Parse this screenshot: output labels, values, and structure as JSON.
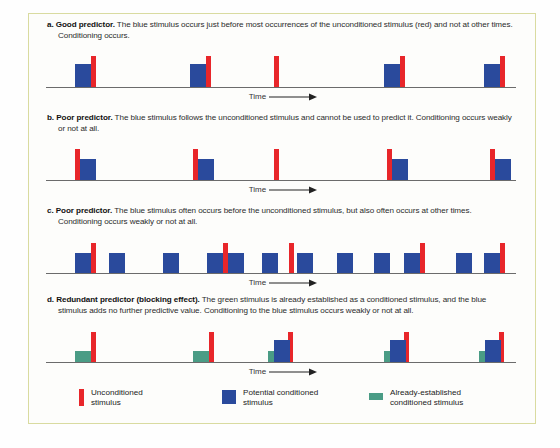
{
  "figure": {
    "border_color": "#d9dba0",
    "background_color": "#fdfdfb"
  },
  "colors": {
    "unconditioned_red": "#e8262a",
    "potential_conditioned_blue": "#2a4a9c",
    "already_established_green": "#4a9c85",
    "axis_gray": "#6b6b6b",
    "frame_olive": "#d9dba0"
  },
  "axis_label": {
    "text": "Time",
    "arrow": "⟶"
  },
  "panels": [
    {
      "id": "a",
      "marker": "a.",
      "title": "Good predictor.",
      "body": "The blue stimulus occurs just before most occurrences of the unconditioned stimulus (red) and not at other times. Conditioning occurs.",
      "time_label": "Time"
    },
    {
      "id": "b",
      "marker": "b.",
      "title": "Poor predictor.",
      "body": "The blue stimulus follows the unconditioned stimulus and cannot be used to predict it. Conditioning occurs weakly or not at all.",
      "time_label": "Time"
    },
    {
      "id": "c",
      "marker": "c.",
      "title": "Poor predictor.",
      "body": "The blue stimulus often occurs before the unconditioned stimulus, but also often occurs at other times. Conditioning occurs weakly or not at all.",
      "time_label": "Time"
    },
    {
      "id": "d",
      "marker": "d.",
      "title": "Redundant predictor (blocking effect).",
      "body": "The green stimulus is already established as a conditioned stimulus, and the blue stimulus adds no further predictive value. Conditioning to the blue stimulus occurs weakly or not at all.",
      "time_label": "Time"
    }
  ],
  "legend": {
    "items": [
      {
        "swatch": "red",
        "label": "Unconditioned\nstimulus"
      },
      {
        "swatch": "blue",
        "label": "Potential conditioned\nstimulus"
      },
      {
        "swatch": "green",
        "label": "Already-established\nconditioned stimulus"
      }
    ]
  },
  "chart_data": {
    "type": "bar",
    "xlabel": "Time",
    "ylabel": "",
    "grid": false,
    "legend_position": "bottom",
    "x_range": [
      0,
      470
    ],
    "series_styles": {
      "red": {
        "width": 5,
        "name": "Unconditioned stimulus"
      },
      "blue": {
        "width": 16,
        "name": "Potential conditioned stimulus"
      },
      "green": {
        "width": 16,
        "name": "Already-established conditioned stimulus"
      }
    },
    "panels": [
      {
        "id": "a",
        "bars": [
          {
            "color": "blue",
            "x": 29,
            "height": 23
          },
          {
            "color": "red",
            "x": 45,
            "height": 31
          },
          {
            "color": "blue",
            "x": 144,
            "height": 23
          },
          {
            "color": "red",
            "x": 160,
            "height": 31
          },
          {
            "color": "red",
            "x": 228,
            "height": 31
          },
          {
            "color": "blue",
            "x": 338,
            "height": 23
          },
          {
            "color": "red",
            "x": 354,
            "height": 31
          },
          {
            "color": "blue",
            "x": 438,
            "height": 23
          },
          {
            "color": "red",
            "x": 454,
            "height": 31
          }
        ]
      },
      {
        "id": "b",
        "bars": [
          {
            "color": "red",
            "x": 29,
            "height": 31
          },
          {
            "color": "blue",
            "x": 34,
            "height": 21
          },
          {
            "color": "red",
            "x": 147,
            "height": 31
          },
          {
            "color": "blue",
            "x": 152,
            "height": 21
          },
          {
            "color": "red",
            "x": 228,
            "height": 31
          },
          {
            "color": "red",
            "x": 341,
            "height": 31
          },
          {
            "color": "blue",
            "x": 346,
            "height": 21
          },
          {
            "color": "red",
            "x": 444,
            "height": 31
          },
          {
            "color": "blue",
            "x": 449,
            "height": 21
          }
        ]
      },
      {
        "id": "c",
        "bars": [
          {
            "color": "blue",
            "x": 29,
            "height": 20
          },
          {
            "color": "red",
            "x": 45,
            "height": 30
          },
          {
            "color": "blue",
            "x": 63,
            "height": 20
          },
          {
            "color": "blue",
            "x": 117,
            "height": 20
          },
          {
            "color": "blue",
            "x": 161,
            "height": 20
          },
          {
            "color": "red",
            "x": 177,
            "height": 30
          },
          {
            "color": "blue",
            "x": 182,
            "height": 20
          },
          {
            "color": "blue",
            "x": 216,
            "height": 20
          },
          {
            "color": "red",
            "x": 243,
            "height": 30
          },
          {
            "color": "blue",
            "x": 251,
            "height": 20
          },
          {
            "color": "blue",
            "x": 291,
            "height": 20
          },
          {
            "color": "blue",
            "x": 328,
            "height": 20
          },
          {
            "color": "blue",
            "x": 358,
            "height": 20
          },
          {
            "color": "red",
            "x": 374,
            "height": 30
          },
          {
            "color": "blue",
            "x": 410,
            "height": 20
          },
          {
            "color": "blue",
            "x": 438,
            "height": 20
          },
          {
            "color": "red",
            "x": 454,
            "height": 30
          }
        ]
      },
      {
        "id": "d",
        "bars": [
          {
            "color": "green",
            "x": 29,
            "height": 11
          },
          {
            "color": "red",
            "x": 45,
            "height": 30
          },
          {
            "color": "green",
            "x": 147,
            "height": 11
          },
          {
            "color": "red",
            "x": 163,
            "height": 30
          },
          {
            "color": "green",
            "x": 222,
            "height": 11
          },
          {
            "color": "blue",
            "x": 228,
            "height": 22
          },
          {
            "color": "red",
            "x": 242,
            "height": 30
          },
          {
            "color": "green",
            "x": 338,
            "height": 11
          },
          {
            "color": "blue",
            "x": 344,
            "height": 22
          },
          {
            "color": "red",
            "x": 358,
            "height": 30
          },
          {
            "color": "green",
            "x": 433,
            "height": 11
          },
          {
            "color": "blue",
            "x": 439,
            "height": 22
          },
          {
            "color": "red",
            "x": 453,
            "height": 30
          }
        ]
      }
    ]
  }
}
